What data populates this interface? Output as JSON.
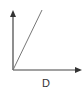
{
  "diagram": {
    "x_axis_label": "D",
    "y_axis_label": "",
    "colors": {
      "axis": "#333333",
      "line": "#777777",
      "background": "#ffffff"
    },
    "line": {
      "description": "straight line from origin rising to the upper right",
      "from": [
        0,
        0
      ],
      "to": [
        1,
        2
      ]
    }
  }
}
